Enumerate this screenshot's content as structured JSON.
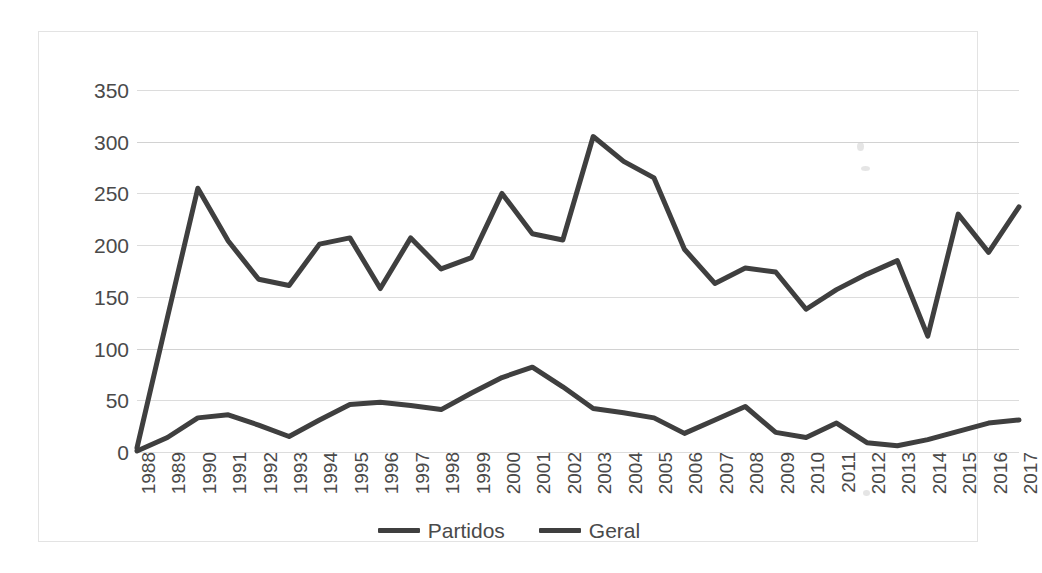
{
  "chart_data": {
    "type": "line",
    "title": "",
    "subtitle": "",
    "xlabel": "",
    "ylabel": "",
    "categories": [
      "1988",
      "1989",
      "1990",
      "1991",
      "1992",
      "1993",
      "1994",
      "1995",
      "1996",
      "1997",
      "1998",
      "1999",
      "2000",
      "2001",
      "2002",
      "2003",
      "2004",
      "2005",
      "2006",
      "2007",
      "2008",
      "2009",
      "2010",
      "2011",
      "2012",
      "2013",
      "2014",
      "2015",
      "2016",
      "2017"
    ],
    "series": [
      {
        "name": "Partidos",
        "color": "#3f3f3f",
        "values": [
          4,
          130,
          255,
          204,
          167,
          161,
          201,
          207,
          158,
          207,
          177,
          188,
          250,
          211,
          205,
          305,
          281,
          265,
          196,
          163,
          178,
          174,
          138,
          157,
          172,
          185,
          112,
          230,
          193,
          237
        ]
      },
      {
        "name": "Geral",
        "color": "#3f3f3f",
        "values": [
          1,
          14,
          33,
          36,
          26,
          15,
          31,
          46,
          48,
          45,
          41,
          57,
          72,
          82,
          63,
          42,
          38,
          33,
          18,
          31,
          44,
          19,
          14,
          28,
          9,
          6,
          12,
          20,
          28,
          31
        ]
      }
    ],
    "ylim": [
      0,
      350
    ],
    "yticks": [
      0,
      50,
      100,
      150,
      200,
      250,
      300,
      350
    ],
    "ytick_labels": [
      "0",
      "50",
      "100",
      "150",
      "200",
      "250",
      "300",
      "350"
    ],
    "grid": "horizontal",
    "legend_position": "bottom",
    "x_label_rotation": -90
  },
  "legend": {
    "entries": [
      {
        "label": "Partidos",
        "swatch_name": "legend-swatch-partidos"
      },
      {
        "label": "Geral",
        "swatch_name": "legend-swatch-geral"
      }
    ]
  },
  "style": {
    "line_color": "#3f3f3f",
    "grid_color": "#dcdcdc",
    "text_color": "#4a4a4a",
    "frame_color": "#e3e3e3",
    "background": "#ffffff"
  }
}
